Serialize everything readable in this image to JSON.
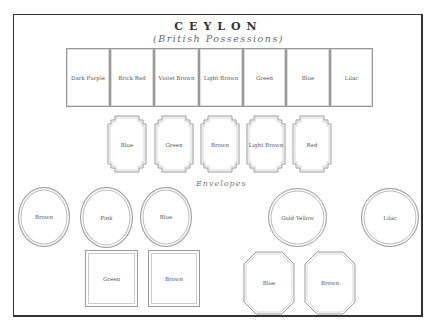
{
  "header": {
    "title": "CEYLON",
    "subtitle": "(British Possessions)"
  },
  "stamps_row1": [
    {
      "label": "Dark Purple"
    },
    {
      "label": "Brick Red"
    },
    {
      "label": "Violet Brown"
    },
    {
      "label": "Light Brown"
    },
    {
      "label": "Green"
    },
    {
      "label": "Blue"
    },
    {
      "label": "Lilac"
    }
  ],
  "stamps_row2": [
    {
      "label": "Blue"
    },
    {
      "label": "Green"
    },
    {
      "label": "Brown"
    },
    {
      "label": "Light Brown"
    },
    {
      "label": "Red"
    }
  ],
  "envelopes": {
    "section_label": "Envelopes",
    "ovals": [
      {
        "label": "Brown"
      },
      {
        "label": "Pink"
      },
      {
        "label": "Blue"
      },
      {
        "label": "Gold Yellow"
      },
      {
        "label": "Lilac"
      }
    ],
    "rectangles": [
      {
        "label": "Green"
      },
      {
        "label": "Brown"
      }
    ],
    "octagons": [
      {
        "label": "Blue"
      },
      {
        "label": "Brown"
      }
    ]
  },
  "colors": {
    "frame": "#333333",
    "outline": "#999999",
    "text": "#555555"
  }
}
